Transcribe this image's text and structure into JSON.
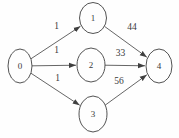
{
  "diagram": {
    "type": "directed-graph",
    "background": "#fefefe",
    "stroke_color": "#3f3f3f",
    "text_color": "#3a3a3a",
    "nodes": [
      {
        "id": "0",
        "label": "0",
        "cx": 20,
        "cy": 66,
        "rx": 12,
        "ry": 17
      },
      {
        "id": "1",
        "label": "1",
        "cx": 93,
        "cy": 18,
        "rx": 13.5,
        "ry": 15.5
      },
      {
        "id": "2",
        "label": "2",
        "cx": 91,
        "cy": 65,
        "rx": 14,
        "ry": 17
      },
      {
        "id": "3",
        "label": "3",
        "cx": 93,
        "cy": 114,
        "rx": 14,
        "ry": 18
      },
      {
        "id": "4",
        "label": "4",
        "cx": 159,
        "cy": 66,
        "rx": 13,
        "ry": 17
      }
    ],
    "edges": [
      {
        "from": "0",
        "to": "1",
        "label": "1",
        "label_x": 56.5,
        "label_y": 26
      },
      {
        "from": "0",
        "to": "2",
        "label": "1",
        "label_x": 56.5,
        "label_y": 50
      },
      {
        "from": "0",
        "to": "3",
        "label": "1",
        "label_x": 57.5,
        "label_y": 78
      },
      {
        "from": "1",
        "to": "4",
        "label": "44",
        "label_x": 132,
        "label_y": 27
      },
      {
        "from": "2",
        "to": "4",
        "label": "33",
        "label_x": 120.5,
        "label_y": 52.5
      },
      {
        "from": "3",
        "to": "4",
        "label": "56",
        "label_x": 119,
        "label_y": 81
      }
    ]
  }
}
